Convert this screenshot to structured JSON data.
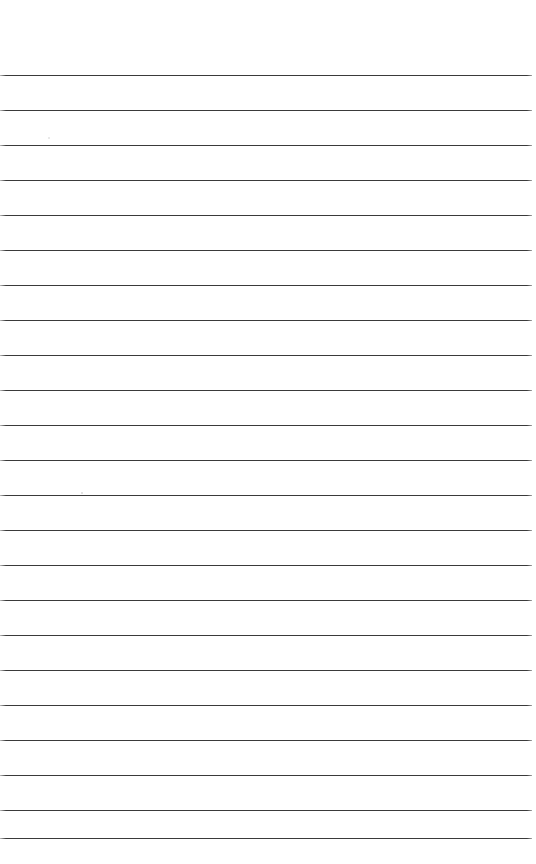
{
  "page": {
    "kind": "ruled-notebook-page",
    "width": 536,
    "height": 864,
    "background_color": "#ffffff",
    "text_content": "",
    "placeholder_note": ""
  },
  "rules": {
    "count": 23,
    "first_line_y": 75,
    "spacing": 35,
    "left_x": 0,
    "right_x": 532,
    "thickness": 1.5,
    "color": "#3a3a3a",
    "positions_y": [
      75,
      110,
      145,
      180,
      215,
      250,
      285,
      320,
      355,
      390,
      425,
      460,
      495,
      530,
      565,
      600,
      635,
      670,
      705,
      740,
      775,
      810,
      838
    ]
  },
  "margins": {
    "top": 75,
    "bottom": 26,
    "left": 0,
    "right": 4
  },
  "marks": [
    {
      "name": "paper-speck",
      "x": 81,
      "y": 492,
      "size": 2,
      "color": "#d8d8d8"
    },
    {
      "name": "paper-speck",
      "x": 48,
      "y": 137,
      "size": 2,
      "color": "#e2e2e2"
    }
  ]
}
